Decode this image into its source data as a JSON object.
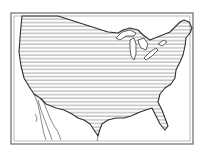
{
  "map": {
    "subject": "Continental United States",
    "style": "engraved illustration with horizontal hatching",
    "colors": {
      "background": "#ffffff",
      "ink": "#3a3a3a",
      "hatch": "#8a8a8a",
      "frame": "#6a6a6a"
    },
    "features": [
      "double-line frame",
      "US land hatched",
      "Great Lakes",
      "Mexico coastline",
      "Florida peninsula"
    ]
  }
}
